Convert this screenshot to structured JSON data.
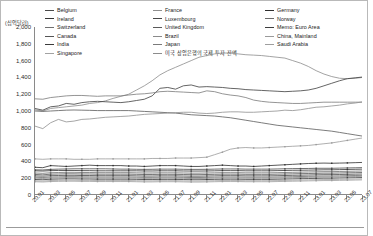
{
  "chart_data": {
    "type": "line",
    "title": "",
    "subtitle": "",
    "xlabel": "",
    "ylabel": "",
    "y_unit_label": "(십억달러)",
    "ylim": [
      0,
      2000
    ],
    "ytick_values": [
      0,
      200,
      400,
      600,
      800,
      1000,
      1200,
      1400,
      1600,
      1800,
      2000
    ],
    "ytick_labels": [
      "0",
      "200",
      "400",
      "600",
      "800",
      "1,000",
      "1,200",
      "1,400",
      "1,600",
      "1,800",
      "2,000"
    ],
    "grid": false,
    "legend_position": "top",
    "x": [
      "20.01",
      "20.02",
      "20.03",
      "20.04",
      "20.05",
      "20.06",
      "20.07",
      "20.08",
      "20.09",
      "20.10",
      "20.11",
      "20.12",
      "21.01",
      "21.02",
      "21.03",
      "21.04",
      "21.05",
      "21.06",
      "21.07",
      "21.08",
      "21.09",
      "21.10",
      "21.11",
      "21.12",
      "22.01",
      "22.02",
      "22.03",
      "22.04",
      "22.05",
      "22.06",
      "22.07",
      "22.08",
      "22.09",
      "22.10",
      "22.11",
      "22.12",
      "23.01",
      "23.02",
      "23.03",
      "23.04",
      "23.05",
      "23.06",
      "23.07"
    ],
    "xtick_labels": [
      "20.01",
      "20.03",
      "20.05",
      "20.07",
      "20.09",
      "20.11",
      "21.01",
      "21.03",
      "21.05",
      "21.07",
      "21.09",
      "21.11",
      "22.01",
      "22.03",
      "22.05",
      "22.07",
      "22.09",
      "22.11",
      "23.01",
      "23.03",
      "23.05",
      "23.07"
    ],
    "series": [
      {
        "name": "미국 상업은행의 국제 투자 잔액",
        "color": "#8c8c8c",
        "values": [
          1015,
          1000,
          1030,
          1040,
          1050,
          1060,
          1070,
          1090,
          1100,
          1120,
          1150,
          1175,
          1200,
          1250,
          1300,
          1360,
          1430,
          1480,
          1520,
          1560,
          1600,
          1640,
          1660,
          1680,
          1690,
          1690,
          1680,
          1670,
          1665,
          1660,
          1650,
          1640,
          1630,
          1600,
          1570,
          1530,
          1480,
          1440,
          1410,
          1390,
          1385,
          1390,
          1400
        ]
      },
      {
        "name": "Memo: Euro Area",
        "color": "#3d3d3d",
        "values": [
          1030,
          1010,
          1050,
          1060,
          1090,
          1080,
          1100,
          1110,
          1115,
          1110,
          1105,
          1100,
          1110,
          1125,
          1140,
          1180,
          1270,
          1280,
          1260,
          1300,
          1310,
          1285,
          1290,
          1285,
          1280,
          1270,
          1265,
          1255,
          1250,
          1245,
          1240,
          1235,
          1230,
          1235,
          1240,
          1250,
          1270,
          1300,
          1330,
          1360,
          1385,
          1395,
          1405
        ]
      },
      {
        "name": "Japan",
        "color": "#7a7a7a",
        "values": [
          1145,
          1140,
          1160,
          1170,
          1180,
          1185,
          1185,
          1180,
          1175,
          1180,
          1180,
          1180,
          1190,
          1200,
          1205,
          1215,
          1230,
          1235,
          1230,
          1225,
          1220,
          1215,
          1240,
          1230,
          1205,
          1190,
          1180,
          1160,
          1130,
          1115,
          1105,
          1100,
          1095,
          1090,
          1090,
          1095,
          1100,
          1105,
          1105,
          1105,
          1105,
          1105,
          1105
        ]
      },
      {
        "name": "United Kingdom",
        "color": "#5a5a5a",
        "values": [
          1000,
          995,
          1000,
          1005,
          1010,
          1012,
          1010,
          1008,
          1005,
          1005,
          1005,
          1005,
          1005,
          1000,
          995,
          990,
          985,
          980,
          975,
          965,
          955,
          950,
          945,
          940,
          930,
          920,
          905,
          890,
          875,
          860,
          845,
          830,
          820,
          810,
          800,
          790,
          780,
          770,
          760,
          745,
          730,
          715,
          700
        ]
      },
      {
        "name": "France",
        "color": "#8f8f8f",
        "values": [
          820,
          790,
          860,
          900,
          870,
          880,
          900,
          905,
          915,
          925,
          930,
          935,
          940,
          950,
          960,
          965,
          970,
          975,
          980,
          985,
          985,
          975,
          970,
          975,
          985,
          990,
          990,
          985,
          985,
          990,
          995,
          1000,
          1010,
          1005,
          1015,
          1030,
          1045,
          1050,
          1060,
          1070,
          1085,
          1095,
          1110
        ]
      },
      {
        "name": "China, Mainland",
        "color": "#9a9a9a",
        "values": [
          430,
          425,
          430,
          430,
          430,
          425,
          425,
          425,
          430,
          430,
          430,
          430,
          430,
          430,
          430,
          435,
          435,
          435,
          440,
          440,
          440,
          445,
          450,
          480,
          510,
          545,
          560,
          565,
          560,
          560,
          565,
          570,
          575,
          580,
          585,
          590,
          600,
          610,
          620,
          635,
          650,
          665,
          680
        ]
      },
      {
        "name": "Germany",
        "color": "#2e2e2e",
        "values": [
          330,
          325,
          350,
          345,
          340,
          345,
          350,
          355,
          350,
          350,
          350,
          350,
          345,
          345,
          340,
          345,
          350,
          350,
          350,
          345,
          340,
          340,
          345,
          350,
          355,
          350,
          345,
          345,
          340,
          345,
          350,
          355,
          360,
          365,
          370,
          375,
          378,
          380,
          378,
          380,
          382,
          385,
          388
        ]
      },
      {
        "name": "Belgium",
        "color": "#4a4a4a",
        "values": [
          300,
          298,
          305,
          308,
          310,
          312,
          312,
          312,
          312,
          312,
          310,
          308,
          308,
          306,
          305,
          306,
          308,
          308,
          308,
          306,
          305,
          305,
          306,
          308,
          310,
          310,
          310,
          308,
          308,
          308,
          308,
          310,
          312,
          314,
          315,
          316,
          318,
          318,
          318,
          320,
          322,
          324,
          326
        ]
      },
      {
        "name": "Ireland",
        "color": "#343434",
        "values": [
          288,
          285,
          290,
          292,
          292,
          292,
          290,
          290,
          288,
          288,
          288,
          288,
          288,
          288,
          286,
          286,
          288,
          288,
          288,
          286,
          285,
          285,
          286,
          288,
          290,
          290,
          290,
          288,
          288,
          288,
          288,
          290,
          292,
          294,
          295,
          296,
          298,
          300,
          300,
          302,
          304,
          306,
          308
        ]
      },
      {
        "name": "Switzerland",
        "color": "#6e6e6e",
        "values": [
          262,
          258,
          265,
          268,
          270,
          270,
          268,
          268,
          266,
          266,
          266,
          266,
          266,
          264,
          262,
          262,
          264,
          264,
          264,
          262,
          260,
          260,
          262,
          264,
          266,
          266,
          266,
          264,
          264,
          264,
          264,
          266,
          268,
          270,
          272,
          274,
          276,
          278,
          278,
          280,
          282,
          284,
          286
        ]
      },
      {
        "name": "Canada",
        "color": "#555555",
        "values": [
          245,
          240,
          248,
          250,
          252,
          252,
          250,
          250,
          248,
          248,
          248,
          248,
          248,
          246,
          244,
          244,
          246,
          246,
          246,
          244,
          242,
          242,
          244,
          246,
          248,
          248,
          248,
          246,
          246,
          246,
          246,
          248,
          250,
          252,
          254,
          256,
          258,
          260,
          260,
          262,
          264,
          266,
          268
        ]
      },
      {
        "name": "Luxembourg",
        "color": "#474747",
        "values": [
          228,
          224,
          230,
          232,
          234,
          234,
          232,
          232,
          230,
          230,
          230,
          230,
          230,
          228,
          226,
          226,
          228,
          228,
          228,
          226,
          224,
          224,
          226,
          228,
          230,
          230,
          230,
          228,
          228,
          228,
          228,
          230,
          232,
          234,
          236,
          238,
          240,
          242,
          242,
          244,
          246,
          248,
          250
        ]
      },
      {
        "name": "Norway",
        "color": "#6a6a6a",
        "values": [
          212,
          208,
          214,
          216,
          218,
          218,
          216,
          216,
          214,
          214,
          214,
          214,
          214,
          212,
          210,
          210,
          212,
          212,
          212,
          210,
          208,
          208,
          210,
          212,
          214,
          214,
          214,
          212,
          212,
          212,
          212,
          214,
          216,
          218,
          220,
          222,
          224,
          226,
          226,
          228,
          230,
          232,
          234
        ]
      },
      {
        "name": "Brazil",
        "color": "#8a8a8a",
        "values": [
          200,
          196,
          202,
          204,
          206,
          206,
          204,
          204,
          202,
          202,
          202,
          202,
          202,
          200,
          198,
          198,
          200,
          200,
          200,
          198,
          196,
          196,
          198,
          200,
          202,
          202,
          202,
          200,
          200,
          200,
          200,
          202,
          204,
          206,
          208,
          210,
          212,
          214,
          214,
          216,
          218,
          220,
          222
        ]
      },
      {
        "name": "India",
        "color": "#3a3a3a",
        "values": [
          185,
          182,
          188,
          190,
          192,
          192,
          190,
          190,
          188,
          188,
          188,
          188,
          188,
          186,
          184,
          184,
          186,
          186,
          186,
          184,
          182,
          182,
          184,
          186,
          188,
          188,
          188,
          186,
          186,
          186,
          186,
          188,
          190,
          192,
          194,
          196,
          198,
          200,
          200,
          202,
          204,
          206,
          208
        ]
      },
      {
        "name": "Singapore",
        "color": "#a2a2a2",
        "values": [
          170,
          166,
          172,
          174,
          176,
          176,
          174,
          174,
          172,
          172,
          172,
          172,
          172,
          170,
          168,
          168,
          170,
          170,
          170,
          168,
          166,
          166,
          168,
          170,
          172,
          172,
          172,
          170,
          170,
          170,
          170,
          172,
          174,
          176,
          178,
          180,
          182,
          184,
          184,
          186,
          188,
          190,
          192
        ]
      },
      {
        "name": "Saudi Arabia",
        "color": "#9e9e9e",
        "values": [
          158,
          155,
          160,
          162,
          164,
          164,
          162,
          162,
          160,
          160,
          160,
          160,
          160,
          158,
          156,
          156,
          158,
          158,
          158,
          156,
          154,
          154,
          156,
          158,
          160,
          160,
          160,
          158,
          158,
          158,
          158,
          160,
          162,
          164,
          166,
          168,
          170,
          172,
          172,
          174,
          176,
          178,
          180
        ]
      }
    ],
    "legend_columns": [
      [
        "Belgium",
        "Ireland",
        "Switzerland",
        "Canada",
        "India",
        "Singapore"
      ],
      [
        "France",
        "Luxembourg",
        "United Kingdom",
        "Brazil",
        "Japan",
        "미국 상업은행의 국제 투자 잔액"
      ],
      [
        "Germany",
        "Norway",
        "Memo: Euro Area",
        "China, Mainland",
        "Saudi Arabia"
      ]
    ]
  }
}
